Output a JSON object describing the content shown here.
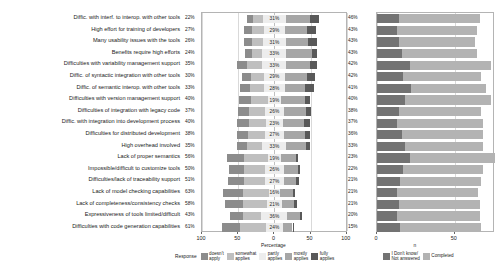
{
  "chart_data": {
    "type": "bar",
    "subtype": "diverging-stacked-likert",
    "title": "",
    "xlabel": "Percentage",
    "xlabel_right": "n",
    "xticks_left": [
      "100",
      "50",
      "0",
      "50",
      "100"
    ],
    "xticks_right": [
      "0",
      "50"
    ],
    "xlim_left": [
      -100,
      100
    ],
    "xlim_right": [
      0,
      75
    ],
    "grid": true,
    "legend_position": "bottom",
    "legend_title": "Response",
    "legend_items": [
      {
        "label": "doesn't\napply",
        "color": "#8c8c8c"
      },
      {
        "label": "somewhat\napplies",
        "color": "#bfbfbf"
      },
      {
        "label": "partly\napplies",
        "color": "#ededed"
      },
      {
        "label": "mostly\napplies",
        "color": "#a6a6a6"
      },
      {
        "label": "fully\napplies",
        "color": "#595959"
      }
    ],
    "legend_items_right": [
      {
        "label": "I Don't know/\nNot answered",
        "color": "#737373"
      },
      {
        "label": "Completed",
        "color": "#b3b3b3"
      }
    ],
    "categories": [
      "Diffic. with interf. to interop. with other tools",
      "High effort for training of developers",
      "Many usability issues with the tools",
      "Benefits require high efforts",
      "Difficulties with variability management support",
      "Diffic. of syntactic integration with other tools",
      "Diffic. of semantic interop. with other tools",
      "Difficulties with version management support",
      "Difficulties of integration with legacy code",
      "Diffic. with integration into development process",
      "Difficulties for distributed development",
      "High overhead involved",
      "Lack of proper semantics",
      "Impossible/difficult to customize tools",
      "Difficulties/lack of traceability support",
      "Lack of model checking capabilities",
      "Lack of completeness/consistency checks",
      "Expressiveness of tools limited/difficult",
      "Difficulties with code generation capabilities"
    ],
    "left_percent_labels": [
      "22%",
      "27%",
      "26%",
      "24%",
      "35%",
      "30%",
      "33%",
      "40%",
      "37%",
      "40%",
      "38%",
      "35%",
      "56%",
      "50%",
      "51%",
      "63%",
      "58%",
      "43%",
      "61%"
    ],
    "mid_percent_labels": [
      "31%",
      "29%",
      "31%",
      "33%",
      "33%",
      "29%",
      "28%",
      "19%",
      "26%",
      "23%",
      "27%",
      "33%",
      "19%",
      "26%",
      "27%",
      "16%",
      "21%",
      "36%",
      "24%"
    ],
    "right_percent_labels": [
      "46%",
      "43%",
      "43%",
      "43%",
      "42%",
      "42%",
      "41%",
      "40%",
      "38%",
      "37%",
      "36%",
      "33%",
      "23%",
      "22%",
      "21%",
      "21%",
      "21%",
      "20%",
      "15%"
    ],
    "series": [
      {
        "name": "doesn't apply",
        "color": "#8c8c8c",
        "values": [
          8,
          11,
          10,
          9,
          14,
          12,
          13,
          17,
          15,
          16,
          15,
          13,
          24,
          21,
          22,
          27,
          25,
          18,
          26
        ]
      },
      {
        "name": "somewhat applies",
        "color": "#bfbfbf",
        "values": [
          14,
          16,
          16,
          15,
          21,
          18,
          20,
          23,
          22,
          24,
          23,
          22,
          32,
          29,
          29,
          36,
          33,
          25,
          35
        ]
      },
      {
        "name": "partly applies",
        "color": "#ededed",
        "values": [
          31,
          29,
          31,
          33,
          33,
          29,
          28,
          19,
          26,
          23,
          27,
          33,
          19,
          26,
          27,
          16,
          21,
          36,
          24
        ]
      },
      {
        "name": "mostly applies",
        "color": "#a6a6a6",
        "values": [
          33,
          31,
          31,
          35,
          32,
          30,
          28,
          33,
          31,
          30,
          29,
          27,
          20,
          19,
          17,
          18,
          17,
          17,
          13
        ]
      },
      {
        "name": "fully applies",
        "color": "#595959",
        "values": [
          13,
          12,
          12,
          8,
          10,
          12,
          13,
          7,
          7,
          7,
          7,
          6,
          3,
          3,
          4,
          3,
          4,
          3,
          2
        ]
      }
    ],
    "counts": [
      {
        "unanswered": 14,
        "completed": 52
      },
      {
        "unanswered": 13,
        "completed": 51
      },
      {
        "unanswered": 14,
        "completed": 49
      },
      {
        "unanswered": 16,
        "completed": 48
      },
      {
        "unanswered": 21,
        "completed": 52
      },
      {
        "unanswered": 17,
        "completed": 50
      },
      {
        "unanswered": 22,
        "completed": 48
      },
      {
        "unanswered": 18,
        "completed": 55
      },
      {
        "unanswered": 14,
        "completed": 53
      },
      {
        "unanswered": 13,
        "completed": 55
      },
      {
        "unanswered": 16,
        "completed": 52
      },
      {
        "unanswered": 18,
        "completed": 50
      },
      {
        "unanswered": 21,
        "completed": 55
      },
      {
        "unanswered": 17,
        "completed": 51
      },
      {
        "unanswered": 15,
        "completed": 52
      },
      {
        "unanswered": 13,
        "completed": 52
      },
      {
        "unanswered": 14,
        "completed": 52
      },
      {
        "unanswered": 13,
        "completed": 53
      },
      {
        "unanswered": 15,
        "completed": 52
      }
    ]
  }
}
